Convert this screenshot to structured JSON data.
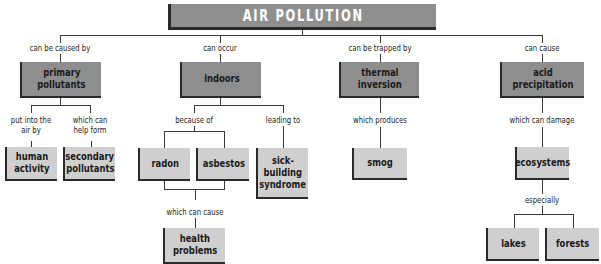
{
  "title": "AIR POLLUTION",
  "branches": [
    {
      "link": "can be caused by",
      "node": "primary pollutants",
      "children": [
        {
          "link": "put into the air by",
          "node": "human activity"
        },
        {
          "link": "which can help form",
          "node": "secondary pollutants"
        }
      ]
    },
    {
      "link": "can occur",
      "node": "indoors",
      "children": [
        {
          "link": "because of",
          "nodes": [
            "radon",
            "asbestos"
          ],
          "then": {
            "link": "which can cause",
            "node": "health problems"
          }
        },
        {
          "link": "leading to",
          "node": "sick-building syndrome"
        }
      ]
    },
    {
      "link": "can be trapped by",
      "node": "thermal inversion",
      "children": [
        {
          "link": "which produces",
          "node": "smog"
        }
      ]
    },
    {
      "link": "can cause",
      "node": "acid precipitation",
      "children": [
        {
          "link": "which can damage",
          "node": "ecosystems",
          "then": {
            "link": "especially",
            "nodes": [
              "lakes",
              "forests"
            ]
          }
        }
      ]
    }
  ],
  "labels": {
    "can_be_caused_by": "can be caused by",
    "can_occur": "can occur",
    "can_be_trapped_by": "can be trapped by",
    "can_cause": "can cause",
    "put_into_1": "put into the",
    "put_into_2": "air by",
    "which_can_1": "which can",
    "which_can_2": "help form",
    "because_of": "because of",
    "leading_to": "leading to",
    "which_produces": "which produces",
    "which_can_damage": "which can damage",
    "which_can_cause": "which can cause",
    "especially": "especially"
  },
  "nodes": {
    "primary_1": "primary",
    "primary_2": "pollutants",
    "indoors": "indoors",
    "thermal_1": "thermal",
    "thermal_2": "inversion",
    "acid": "acid precipitation",
    "human_1": "human",
    "human_2": "activity",
    "secondary_1": "secondary",
    "secondary_2": "pollutants",
    "radon": "radon",
    "asbestos": "asbestos",
    "sick_1": "sick-",
    "sick_2": "building",
    "sick_3": "syndrome",
    "smog": "smog",
    "ecosystems": "ecosystems",
    "health_1": "health",
    "health_2": "problems",
    "lakes": "lakes",
    "forests": "forests"
  },
  "colors": {
    "dark_box": "#8e8e8e",
    "light_box": "#cfcfcf",
    "shadow": "#2a2a2a",
    "title_text": "#ffffff"
  }
}
